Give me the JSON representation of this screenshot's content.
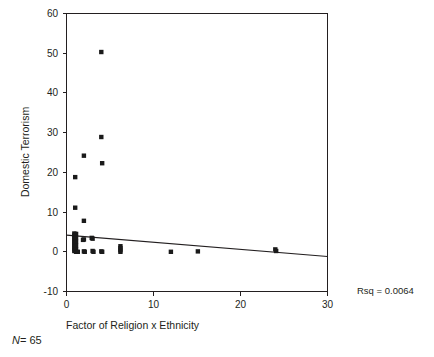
{
  "chart_data": {
    "type": "scatter",
    "title": "",
    "xlabel": "Factor of Religion x Ethnicity",
    "ylabel": "Domestic Terrorism",
    "xlim": [
      0,
      30
    ],
    "ylim": [
      -10,
      60
    ],
    "xticks": [
      0,
      10,
      20,
      30
    ],
    "xtick_labels": [
      "0",
      "10",
      "20",
      "30"
    ],
    "yticks": [
      -10,
      0,
      10,
      20,
      30,
      40,
      50,
      60
    ],
    "ytick_labels": [
      "-10",
      "0",
      "10",
      "20",
      "30",
      "40",
      "50",
      "60"
    ],
    "grid": false,
    "legend": false,
    "marker": "square",
    "marker_color": "#1a1a1a",
    "points": [
      [
        4.0,
        50.3
      ],
      [
        4.0,
        28.9
      ],
      [
        2.0,
        24.2
      ],
      [
        4.1,
        22.3
      ],
      [
        1.0,
        18.8
      ],
      [
        1.0,
        11.1
      ],
      [
        2.0,
        7.8
      ],
      [
        0.9,
        4.6
      ],
      [
        0.9,
        4.1
      ],
      [
        0.9,
        3.6
      ],
      [
        0.9,
        3.1
      ],
      [
        0.9,
        2.6
      ],
      [
        0.9,
        2.1
      ],
      [
        0.9,
        1.6
      ],
      [
        0.9,
        1.1
      ],
      [
        0.9,
        0.6
      ],
      [
        0.9,
        0.2
      ],
      [
        1.0,
        4.3
      ],
      [
        1.0,
        3.8
      ],
      [
        1.0,
        3.3
      ],
      [
        1.0,
        2.8
      ],
      [
        1.0,
        2.3
      ],
      [
        1.0,
        1.8
      ],
      [
        1.0,
        1.3
      ],
      [
        1.0,
        0.8
      ],
      [
        1.0,
        0.3
      ],
      [
        1.1,
        4.5
      ],
      [
        1.1,
        3.5
      ],
      [
        1.1,
        2.5
      ],
      [
        1.1,
        1.5
      ],
      [
        1.1,
        0.5
      ],
      [
        1.1,
        0.0
      ],
      [
        1.3,
        0.0
      ],
      [
        1.9,
        3.0
      ],
      [
        2.0,
        3.1
      ],
      [
        2.0,
        0.1
      ],
      [
        2.1,
        0.0
      ],
      [
        2.9,
        3.5
      ],
      [
        3.0,
        3.3
      ],
      [
        3.0,
        0.2
      ],
      [
        3.1,
        0.0
      ],
      [
        4.0,
        0.1
      ],
      [
        4.1,
        0.0
      ],
      [
        6.2,
        1.4
      ],
      [
        6.2,
        0.9
      ],
      [
        6.2,
        0.4
      ],
      [
        6.2,
        0.0
      ],
      [
        12.0,
        0.0
      ],
      [
        15.1,
        0.1
      ],
      [
        24.0,
        0.6
      ],
      [
        24.1,
        0.2
      ]
    ],
    "fit_line": {
      "x": [
        0,
        30
      ],
      "y": [
        4.2,
        -1.2
      ],
      "style": "solid"
    },
    "annotations": [
      {
        "name": "rsq",
        "text": "Rsq = 0.0064",
        "x": 24.5,
        "y": -10.0
      }
    ],
    "footnote": "N = 65",
    "footnote_label": "N",
    "footnote_value": "= 65"
  }
}
